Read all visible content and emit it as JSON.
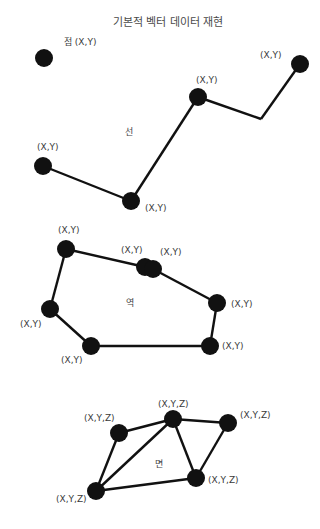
{
  "title": "기본적 벡터 데이터 재현",
  "colors": {
    "node": "#111111",
    "edge": "#111111",
    "text": "#3a3a3a"
  },
  "point": {
    "section_label": "점 (X,Y)",
    "nodes": [
      {
        "x": 44,
        "y": 58,
        "label": ""
      }
    ]
  },
  "line": {
    "section_label": "선",
    "nodes": [
      {
        "x": 43,
        "y": 166,
        "label": "(X,Y)"
      },
      {
        "x": 131,
        "y": 201,
        "label": "(X,Y)"
      },
      {
        "x": 198,
        "y": 97,
        "label": "(X,Y)"
      },
      {
        "x": 300,
        "y": 64,
        "label": "(X,Y)"
      }
    ],
    "path": [
      [
        43,
        166
      ],
      [
        131,
        201
      ],
      [
        198,
        97
      ],
      [
        261,
        119
      ],
      [
        300,
        64
      ]
    ]
  },
  "polygon": {
    "section_label": "역",
    "nodes": [
      {
        "x": 66,
        "y": 249,
        "label": "(X,Y)"
      },
      {
        "x": 145,
        "y": 267,
        "label": "(X,Y)"
      },
      {
        "x": 153,
        "y": 269,
        "label": "(X,Y)"
      },
      {
        "x": 217,
        "y": 303,
        "label": "(X,Y)"
      },
      {
        "x": 210,
        "y": 346,
        "label": "(X,Y)"
      },
      {
        "x": 91,
        "y": 346,
        "label": "(X,Y)"
      },
      {
        "x": 50,
        "y": 309,
        "label": "(X,Y)"
      }
    ]
  },
  "tin": {
    "section_label": "면",
    "nodes": [
      {
        "x": 119,
        "y": 433,
        "label": "(X,Y,Z)"
      },
      {
        "x": 173,
        "y": 419,
        "label": "(X,Y,Z)"
      },
      {
        "x": 228,
        "y": 423,
        "label": "(X,Y,Z)"
      },
      {
        "x": 196,
        "y": 478,
        "label": "(X,Y,Z)"
      },
      {
        "x": 96,
        "y": 491,
        "label": "(X,Y,Z)"
      }
    ],
    "edges": [
      [
        0,
        1
      ],
      [
        1,
        2
      ],
      [
        2,
        3
      ],
      [
        3,
        4
      ],
      [
        4,
        0
      ],
      [
        4,
        1
      ],
      [
        1,
        3
      ]
    ]
  }
}
